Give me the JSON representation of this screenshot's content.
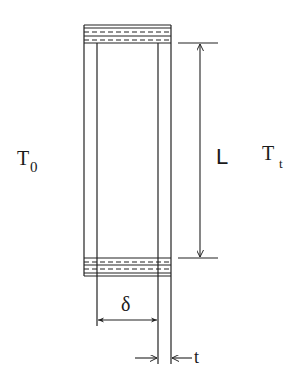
{
  "diagram": {
    "colors": {
      "stroke": "#222222",
      "background": "#ffffff"
    },
    "labels": {
      "left_temp_main": "T",
      "left_temp_sub": "0",
      "right_temp_main": "T",
      "right_temp_sub": "t",
      "length": "L",
      "spacing": "δ",
      "thickness": "t"
    },
    "elements": {
      "outer_box": {
        "x1": 84,
        "x2": 171,
        "top": 25,
        "bottom": 276
      },
      "inner_walls": {
        "left_x": 97,
        "right_x": 158
      },
      "top_band": {
        "y_top": 25,
        "y_bottom": 43,
        "dashed_rows": 2
      },
      "bottom_band": {
        "y_top": 258,
        "y_bottom": 276,
        "dashed_rows": 2
      },
      "L_dimension": {
        "x": 200,
        "y_from": 43,
        "y_to": 258
      },
      "delta_dimension": {
        "y": 320,
        "x_from": 97,
        "x_to": 158
      },
      "t_dimension": {
        "y": 358,
        "x_from": 158,
        "x_to": 171
      }
    }
  }
}
